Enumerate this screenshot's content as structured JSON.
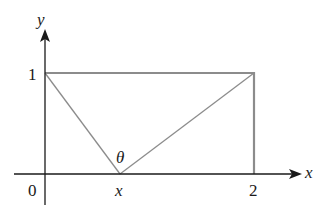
{
  "diagram": {
    "type": "geometry-figure",
    "colors": {
      "axis": "#1a1a1a",
      "shape": "#8c8c8c",
      "background": "#ffffff"
    },
    "axes": {
      "x_label": "x",
      "y_label": "y"
    },
    "ticks": {
      "origin": "0",
      "y_one": "1",
      "x_two": "2",
      "x_point": "x"
    },
    "angle_label": "θ",
    "rectangle": {
      "corners": [
        [
          0,
          0
        ],
        [
          2,
          0
        ],
        [
          2,
          1
        ],
        [
          0,
          1
        ]
      ]
    },
    "segments": [
      {
        "from": [
          0,
          1
        ],
        "to": [
          "x",
          0
        ]
      },
      {
        "from": [
          "x",
          0
        ],
        "to": [
          2,
          1
        ]
      }
    ]
  }
}
